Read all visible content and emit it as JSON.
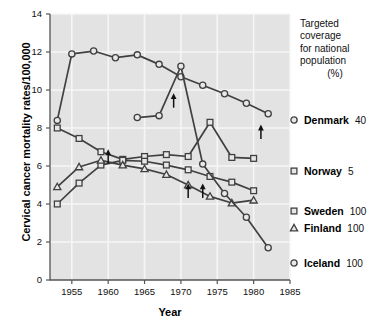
{
  "chart_data": {
    "type": "line",
    "title": "",
    "xlabel": "Year",
    "ylabel": "Cervical cancer mortality rates/100,000",
    "xlim": [
      1952,
      1985
    ],
    "ylim": [
      0,
      14
    ],
    "xticks": [
      1955,
      1960,
      1965,
      1970,
      1975,
      1980,
      1985
    ],
    "yticks": [
      0,
      2,
      4,
      6,
      8,
      10,
      12,
      14
    ],
    "grid": true,
    "legend_position": "right",
    "legend_title": [
      "Targeted",
      "coverage",
      "for national",
      "population"
    ],
    "legend_units": "(%)",
    "series": [
      {
        "name": "Denmark",
        "coverage": 40,
        "marker": "circle",
        "x": [
          1953,
          1955,
          1958,
          1961,
          1964,
          1967,
          1970,
          1973,
          1976,
          1979,
          1982
        ],
        "y": [
          8.4,
          11.9,
          12.05,
          11.7,
          11.85,
          11.35,
          10.7,
          10.25,
          9.8,
          9.3,
          8.75
        ]
      },
      {
        "name": "Norway",
        "coverage": 5,
        "marker": "square",
        "x": [
          1953,
          1956,
          1959,
          1962,
          1965,
          1968,
          1971,
          1974,
          1977,
          1980
        ],
        "y": [
          8.0,
          7.45,
          6.75,
          6.35,
          6.5,
          6.6,
          6.5,
          8.3,
          6.45,
          6.4
        ]
      },
      {
        "name": "Sweden",
        "coverage": 100,
        "marker": "square",
        "x": [
          1953,
          1956,
          1959,
          1962,
          1965,
          1968,
          1971,
          1974,
          1977,
          1980
        ],
        "y": [
          4.0,
          5.1,
          6.05,
          6.3,
          6.25,
          6.05,
          5.8,
          5.45,
          5.15,
          4.7
        ]
      },
      {
        "name": "Finland",
        "coverage": 100,
        "marker": "triangle",
        "x": [
          1953,
          1956,
          1959,
          1962,
          1965,
          1968,
          1971,
          1974,
          1977,
          1980
        ],
        "y": [
          4.9,
          5.95,
          6.3,
          6.05,
          5.85,
          5.55,
          5.0,
          4.4,
          4.05,
          4.2
        ]
      },
      {
        "name": "Iceland",
        "coverage": 100,
        "marker": "circle",
        "x": [
          1964,
          1967,
          1970,
          1973,
          1976,
          1979,
          1982
        ],
        "y": [
          8.55,
          8.65,
          11.25,
          6.1,
          4.55,
          3.3,
          1.7
        ]
      }
    ],
    "annotations": [
      {
        "label": "arrow-up",
        "x": 1960,
        "y": 6.75
      },
      {
        "label": "arrow-up",
        "x": 1969,
        "y": 9.7
      },
      {
        "label": "arrow-up",
        "x": 1971,
        "y": 4.95
      },
      {
        "label": "arrow-up",
        "x": 1973,
        "y": 4.95
      },
      {
        "label": "arrow-up",
        "x": 1981,
        "y": 8.05
      }
    ]
  },
  "legend": {
    "title_lines": [
      "Targeted",
      "coverage",
      "for national",
      "population"
    ],
    "units": "(%)",
    "entries": [
      {
        "name": "Denmark",
        "value": "40",
        "marker": "circle"
      },
      {
        "name": "Norway",
        "value": "5",
        "marker": "square"
      },
      {
        "name": "Sweden",
        "value": "100",
        "marker": "square"
      },
      {
        "name": "Finland",
        "value": "100",
        "marker": "triangle"
      },
      {
        "name": "Iceland",
        "value": "100",
        "marker": "circle"
      }
    ]
  },
  "axes": {
    "y_title": "Cervical cancer mortality rates/100,000",
    "x_title": "Year",
    "y_tick_labels": [
      "0",
      "2",
      "4",
      "6",
      "8",
      "10",
      "12",
      "14"
    ],
    "x_tick_labels": [
      "1955",
      "1960",
      "1965",
      "1970",
      "1975",
      "1980",
      "1985"
    ]
  },
  "colors": {
    "plot_background": "#e3e3e3",
    "grid": "#f4f4f4",
    "line": "#404040",
    "marker_fill": "#e8e8e8",
    "text": "#111111"
  }
}
